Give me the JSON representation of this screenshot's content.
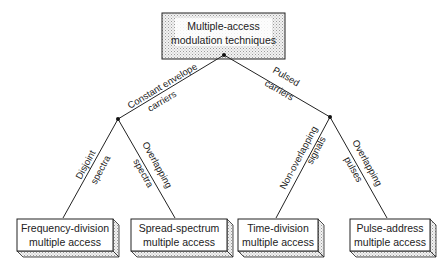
{
  "root": {
    "line1": "Multiple-access",
    "line2": "modulation techniques"
  },
  "branches": {
    "left": {
      "label1": "Constant envelope",
      "label2": "carriers"
    },
    "right": {
      "label1": "Pulsed",
      "label2": "carriers"
    }
  },
  "sub_branches": {
    "ll": {
      "label1": "Disjoint",
      "label2": "spectra"
    },
    "lr": {
      "label1": "Overlapping",
      "label2": "spectra"
    },
    "rl": {
      "label1": "Non-overlapping",
      "label2": "signals"
    },
    "rr": {
      "label1": "Overlapping",
      "label2": "pulses"
    }
  },
  "leaves": [
    {
      "line1": "Frequency-division",
      "line2": "multiple access"
    },
    {
      "line1": "Spread-spectrum",
      "line2": "multiple access"
    },
    {
      "line1": "Time-division",
      "line2": "multiple access"
    },
    {
      "line1": "Pulse-address",
      "line2": "multiple access"
    }
  ],
  "colors": {
    "line": "#222222",
    "shade": "#cfcfcf",
    "box_fill": "#ffffff",
    "root_fill": "#e4e4e4"
  }
}
